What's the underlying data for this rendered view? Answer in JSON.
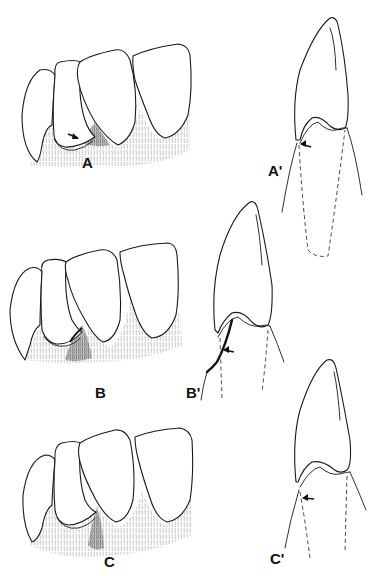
{
  "figure": {
    "panels": [
      {
        "id": "A",
        "label": "A",
        "view": "labial"
      },
      {
        "id": "A-prime",
        "label": "A'",
        "view": "sagittal"
      },
      {
        "id": "B",
        "label": "B",
        "view": "labial"
      },
      {
        "id": "B-prime",
        "label": "B'",
        "view": "sagittal"
      },
      {
        "id": "C",
        "label": "C",
        "view": "labial"
      },
      {
        "id": "C-prime",
        "label": "C'",
        "view": "sagittal"
      }
    ],
    "colors": {
      "line": "#1a1a1a",
      "shading": "#9a9a9a",
      "background": "#ffffff"
    }
  }
}
